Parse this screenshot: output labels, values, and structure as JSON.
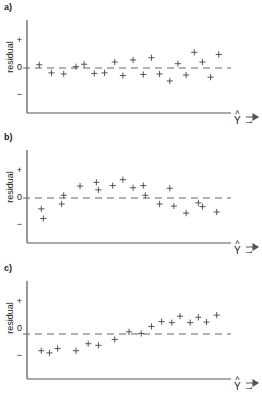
{
  "figure": {
    "caption_panels": [
      "a)",
      "b)",
      "c)"
    ],
    "axis": {
      "ylabel": "residual",
      "ytick_positive": "+",
      "ytick_zero": "0",
      "ytick_negative": "−",
      "xlabel_base": "Y",
      "xlabel_hat": "^",
      "xlabel_arrow": "→"
    },
    "marker": "+",
    "colors": {
      "axis": "#555555",
      "marker": "#444444",
      "zero_line": "#666666",
      "text": "#222222"
    }
  },
  "chart_data": [
    {
      "type": "scatter",
      "title": "a)",
      "xlabel": "Y-hat",
      "ylabel": "residual",
      "ylim": [
        -1,
        1
      ],
      "xlim": [
        0,
        1
      ],
      "grid": false,
      "zero_line": 0,
      "annotation": "random scatter about zero - no pattern",
      "x": [
        0.06,
        0.12,
        0.18,
        0.24,
        0.28,
        0.33,
        0.38,
        0.43,
        0.47,
        0.52,
        0.57,
        0.61,
        0.65,
        0.7,
        0.74,
        0.78,
        0.82,
        0.86,
        0.9,
        0.94
      ],
      "y": [
        0.12,
        -0.18,
        -0.22,
        0.05,
        0.14,
        -0.2,
        -0.18,
        0.22,
        -0.28,
        0.3,
        -0.24,
        0.38,
        -0.22,
        -0.48,
        0.16,
        -0.26,
        0.58,
        0.22,
        -0.34,
        0.5
      ]
    },
    {
      "type": "scatter",
      "title": "b)",
      "xlabel": "Y-hat",
      "ylabel": "residual",
      "ylim": [
        -1,
        1
      ],
      "xlim": [
        0,
        1
      ],
      "grid": false,
      "zero_line": 0,
      "annotation": "curvature - inverted U pattern indicates model misspecification",
      "x": [
        0.07,
        0.08,
        0.17,
        0.18,
        0.26,
        0.34,
        0.35,
        0.42,
        0.47,
        0.52,
        0.57,
        0.58,
        0.65,
        0.7,
        0.72,
        0.78,
        0.84,
        0.86,
        0.93
      ],
      "y": [
        -0.4,
        -0.76,
        -0.22,
        0.1,
        0.44,
        0.58,
        0.3,
        0.46,
        0.68,
        0.38,
        0.46,
        0.1,
        -0.22,
        0.36,
        -0.3,
        -0.56,
        -0.18,
        -0.32,
        -0.52
      ]
    },
    {
      "type": "scatter",
      "title": "c)",
      "xlabel": "Y-hat",
      "ylabel": "residual",
      "ylim": [
        -1,
        1
      ],
      "xlim": [
        0,
        1
      ],
      "grid": false,
      "zero_line": 0,
      "annotation": "residuals increase with fitted values - linear trend",
      "x": [
        0.07,
        0.11,
        0.15,
        0.24,
        0.3,
        0.35,
        0.43,
        0.5,
        0.56,
        0.61,
        0.66,
        0.71,
        0.75,
        0.8,
        0.84,
        0.88,
        0.93
      ],
      "y": [
        -0.62,
        -0.7,
        -0.54,
        -0.62,
        -0.36,
        -0.42,
        -0.2,
        0.08,
        0.02,
        0.28,
        0.46,
        0.42,
        0.66,
        0.42,
        0.62,
        0.44,
        0.7
      ]
    }
  ]
}
